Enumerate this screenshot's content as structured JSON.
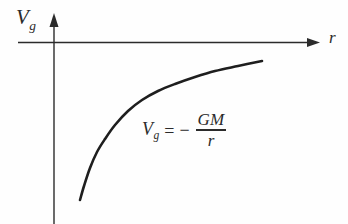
{
  "figure": {
    "type": "gravitational-potential-diagram",
    "background_color": "#fefefe",
    "stroke_color": "#2b2b2b",
    "axes": {
      "y_axis_label_main": "V",
      "y_axis_label_sub": "g",
      "x_axis_label": "r",
      "origin": {
        "x": 54,
        "y": 42
      },
      "x_axis_start_x": 18,
      "x_axis_end_x": 320,
      "y_axis_top_y": 14,
      "y_axis_bottom_y": 224
    },
    "annotation": {
      "lhs_main": "V",
      "lhs_sub": "g",
      "equals": "=",
      "minus": "−",
      "numerator": "GM",
      "denominator": "r"
    }
  },
  "chart_data": {
    "type": "line",
    "title": "",
    "xlabel": "r",
    "ylabel": "V_g",
    "grid": false,
    "legend": null,
    "annotations": [
      "V_g = − GM / r"
    ],
    "series": [
      {
        "name": "V_g = -GM/r",
        "x": [
          80,
          84,
          90,
          97,
          105,
          115,
          128,
          142,
          158,
          175,
          195,
          215,
          238,
          262
        ],
        "y": [
          200,
          186,
          168,
          152,
          139,
          125,
          111,
          100,
          91,
          84,
          77,
          71,
          66,
          61
        ]
      }
    ],
    "xlim": [
      54,
      320
    ],
    "ylim": [
      224,
      42
    ]
  }
}
